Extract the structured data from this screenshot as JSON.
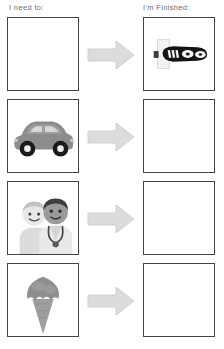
{
  "page": {
    "background_color": "#ffffff"
  },
  "columns": {
    "need_label": "I need to:",
    "finished_label": "I'm Finished:"
  },
  "style": {
    "border_color": "#444444",
    "arrow_fill": "#dcdcdc",
    "arrow_stroke": "#c9c9c9",
    "header_text_color": "#6d6d6d"
  },
  "rows": [
    {
      "index": 1,
      "need": {
        "icon": "empty-slot",
        "label": "",
        "filled": false
      },
      "arrow": {
        "icon": "right-arrow-icon",
        "label": "then"
      },
      "finished": {
        "icon": "dark-vehicle-icon",
        "label": "dark vehicle",
        "filled": true
      }
    },
    {
      "index": 2,
      "need": {
        "icon": "car-icon",
        "label": "car",
        "filled": true
      },
      "arrow": {
        "icon": "right-arrow-icon",
        "label": "then"
      },
      "finished": {
        "icon": "empty-slot",
        "label": "",
        "filled": false
      }
    },
    {
      "index": 3,
      "need": {
        "icon": "doctor-and-patient-icon",
        "label": "doctor and patient",
        "filled": true
      },
      "arrow": {
        "icon": "right-arrow-icon",
        "label": "then"
      },
      "finished": {
        "icon": "empty-slot",
        "label": "",
        "filled": false
      }
    },
    {
      "index": 4,
      "need": {
        "icon": "ice-cream-cone-icon",
        "label": "ice cream cone",
        "filled": true
      },
      "arrow": {
        "icon": "right-arrow-icon",
        "label": "then"
      },
      "finished": {
        "icon": "empty-slot",
        "label": "",
        "filled": false
      }
    }
  ]
}
